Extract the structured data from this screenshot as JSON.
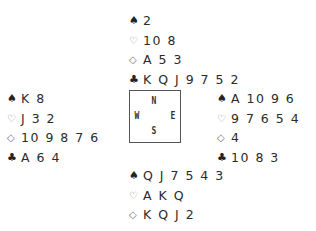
{
  "suits": {
    "spade": "♠",
    "heart": "♡",
    "diamond": "◇",
    "club": "♣"
  },
  "compass": {
    "n": "N",
    "s": "S",
    "w": "W",
    "e": "E"
  },
  "hands": {
    "north": {
      "spades": "2",
      "hearts": "10 8",
      "diamonds": "A 5 3",
      "clubs": "K Q J 9 7 5 2"
    },
    "west": {
      "spades": "K 8",
      "hearts": "J 3 2",
      "diamonds": "10 9 8 7 6",
      "clubs": "A 6 4"
    },
    "east": {
      "spades": "A 10 9 6",
      "hearts": "9 7 6 5 4",
      "diamonds": "4",
      "clubs": "10 8 3"
    },
    "south": {
      "spades": "Q J 7 5 4 3",
      "hearts": "A K Q",
      "diamonds": "K Q J 2",
      "clubs": "—"
    }
  }
}
